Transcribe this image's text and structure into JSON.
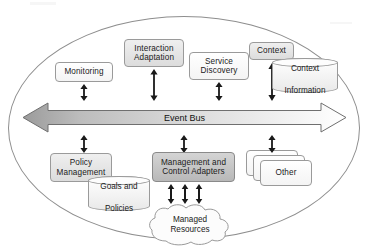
{
  "diagram": {
    "boundary_name": "system-boundary-ellipse",
    "bus": {
      "label": "Event Bus",
      "direction": "bidirectional",
      "fill_start": "#9e9e9e",
      "fill_end": "#ffffff",
      "stroke": "#6f6f6f"
    },
    "top_components": [
      {
        "id": "monitoring",
        "label": "Monitoring",
        "style": "white"
      },
      {
        "id": "interaction-adaptation",
        "label_line1": "Interaction",
        "label_line2": "Adaptation",
        "style": "light"
      },
      {
        "id": "service-discovery",
        "label_line1": "Service",
        "label_line2": "Discovery",
        "style": "white"
      },
      {
        "id": "context",
        "label": "Context",
        "style": "light"
      }
    ],
    "bottom_components": [
      {
        "id": "policy-management",
        "label_line1": "Policy",
        "label_line2": "Management",
        "style": "light"
      },
      {
        "id": "management-control-adapters",
        "label_line1": "Management and",
        "label_line2": "Control Adapters",
        "style": "mid"
      },
      {
        "id": "other",
        "label": "Other",
        "style": "white",
        "stack_count": 3
      }
    ],
    "datastores": [
      {
        "id": "context-information",
        "label_line1": "Context",
        "label_line2": "Information"
      },
      {
        "id": "goals-and-policies",
        "label_line1": "Goals and",
        "label_line2": "Policies"
      }
    ],
    "cloud": {
      "id": "managed-resources",
      "label_line1": "Managed",
      "label_line2": "Resources"
    },
    "connectors": {
      "type": "double-headed-arrow",
      "above_bus_count": 4,
      "below_bus_count": 3,
      "adapters_to_resources_count": 3,
      "color": "#1a1a1a"
    },
    "colors": {
      "box_white": "#fdfdfd",
      "box_light": "#e6e6e6",
      "box_mid": "#c7c7c7",
      "border": "#9a9a9a",
      "boundary": "#8e8e8e",
      "text": "#1a1a1a"
    }
  }
}
